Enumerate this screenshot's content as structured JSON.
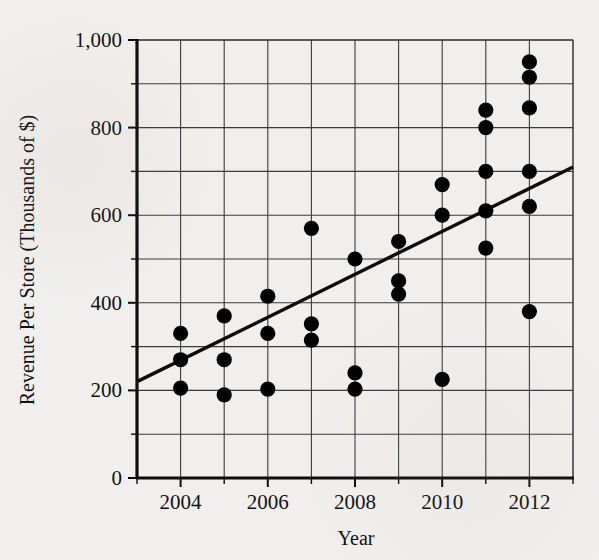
{
  "chart_data": {
    "type": "scatter",
    "title": "",
    "xlabel": "Year",
    "ylabel": "Revenue Per Store (Thousands of $)",
    "xlim": [
      2003,
      2013
    ],
    "ylim": [
      0,
      1000
    ],
    "x_ticks": [
      2004,
      2006,
      2008,
      2010,
      2012
    ],
    "x_tick_labels": [
      "2004",
      "2006",
      "2008",
      "2010",
      "2012"
    ],
    "x_minor_step": 1,
    "y_ticks": [
      0,
      200,
      400,
      600,
      800,
      1000
    ],
    "y_tick_labels": [
      "0",
      "200",
      "400",
      "600",
      "800",
      "1,000"
    ],
    "y_minor_step": 100,
    "grid": true,
    "legend": "none",
    "marker": "filled-circle",
    "marker_color": "#000000",
    "points": [
      {
        "x": 2004,
        "y": 330
      },
      {
        "x": 2004,
        "y": 270
      },
      {
        "x": 2004,
        "y": 205
      },
      {
        "x": 2005,
        "y": 370
      },
      {
        "x": 2005,
        "y": 270
      },
      {
        "x": 2005,
        "y": 190
      },
      {
        "x": 2006,
        "y": 415
      },
      {
        "x": 2006,
        "y": 330
      },
      {
        "x": 2006,
        "y": 203
      },
      {
        "x": 2007,
        "y": 570
      },
      {
        "x": 2007,
        "y": 352
      },
      {
        "x": 2007,
        "y": 315
      },
      {
        "x": 2008,
        "y": 500
      },
      {
        "x": 2008,
        "y": 240
      },
      {
        "x": 2008,
        "y": 203
      },
      {
        "x": 2009,
        "y": 540
      },
      {
        "x": 2009,
        "y": 450
      },
      {
        "x": 2009,
        "y": 420
      },
      {
        "x": 2010,
        "y": 670
      },
      {
        "x": 2010,
        "y": 600
      },
      {
        "x": 2010,
        "y": 225
      },
      {
        "x": 2011,
        "y": 840
      },
      {
        "x": 2011,
        "y": 800
      },
      {
        "x": 2011,
        "y": 700
      },
      {
        "x": 2011,
        "y": 610
      },
      {
        "x": 2011,
        "y": 525
      },
      {
        "x": 2012,
        "y": 950
      },
      {
        "x": 2012,
        "y": 915
      },
      {
        "x": 2012,
        "y": 845
      },
      {
        "x": 2012,
        "y": 700
      },
      {
        "x": 2012,
        "y": 620
      },
      {
        "x": 2012,
        "y": 380
      }
    ],
    "trendline": {
      "label": "",
      "x_start": 2003,
      "y_start": 220,
      "x_end": 2013,
      "y_end": 710
    }
  }
}
